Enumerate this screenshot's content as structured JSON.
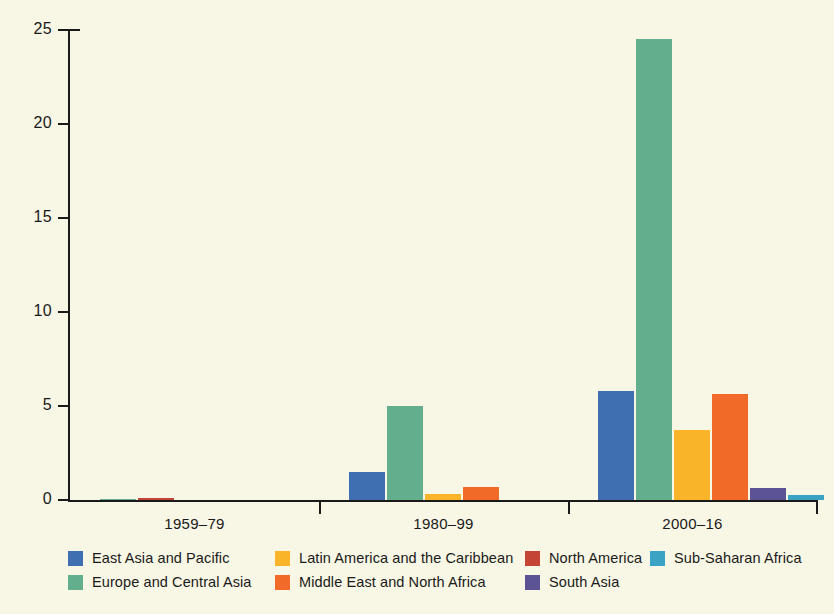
{
  "chart_data": {
    "type": "bar",
    "title": "",
    "subtitle": "",
    "xlabel": "",
    "ylabel": "",
    "categories": [
      "1959–79",
      "1980–99",
      "2000–16"
    ],
    "ylim": [
      0,
      25
    ],
    "yticks": [
      0,
      5,
      10,
      15,
      20,
      25
    ],
    "ytick_labels": [
      "0",
      "5",
      "10",
      "15",
      "20",
      "25"
    ],
    "grid": false,
    "legend_position": "bottom",
    "series": [
      {
        "name": "East Asia and Pacific",
        "color": "#3f6fb0",
        "values": [
          0,
          1.5,
          5.8
        ]
      },
      {
        "name": "Europe and Central Asia",
        "color": "#63ae8c",
        "values": [
          0.05,
          5.0,
          24.5
        ]
      },
      {
        "name": "Latin America and the Caribbean",
        "color": "#fab429",
        "values": [
          0,
          0.3,
          3.7
        ]
      },
      {
        "name": "Middle East and North Africa",
        "color": "#f26a27",
        "values": [
          0,
          0.7,
          5.65
        ]
      },
      {
        "name": "North America",
        "color": "#c44536",
        "values": [
          0.12,
          0,
          0
        ]
      },
      {
        "name": "South Asia",
        "color": "#5b5394",
        "values": [
          0,
          0,
          0.65
        ]
      },
      {
        "name": "Sub-Saharan Africa",
        "color": "#3aa3c4",
        "values": [
          0,
          0,
          0.28
        ]
      }
    ]
  },
  "legend": {
    "items": [
      {
        "label": "East Asia and Pacific",
        "color": "#3f6fb0"
      },
      {
        "label": "Europe and Central Asia",
        "color": "#63ae8c"
      },
      {
        "label": "Latin America and the Caribbean",
        "color": "#fab429"
      },
      {
        "label": "Middle East and North Africa",
        "color": "#f26a27"
      },
      {
        "label": "North America",
        "color": "#c44536"
      },
      {
        "label": "South Asia",
        "color": "#5b5394"
      },
      {
        "label": "Sub-Saharan Africa",
        "color": "#3aa3c4"
      }
    ]
  },
  "colors": {
    "background": "#f8f6e4",
    "axis": "#1a1a1a",
    "text": "#1a1a1a"
  }
}
